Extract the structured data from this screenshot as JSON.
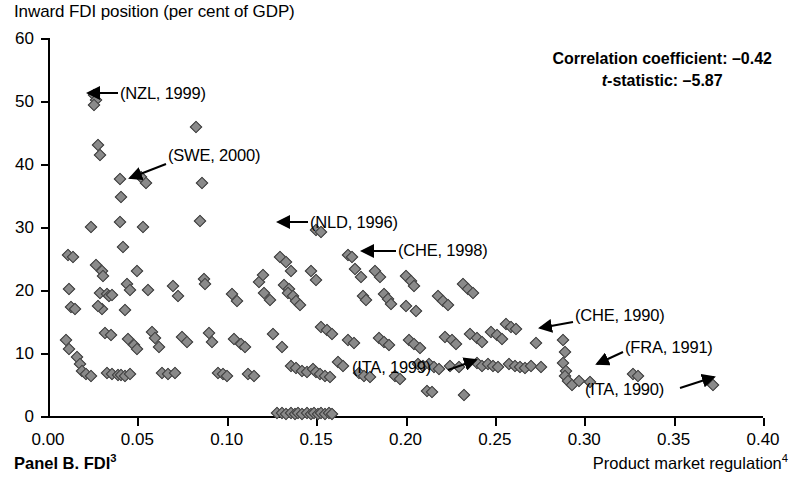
{
  "figure": {
    "y_axis_title": "Inward FDI position (per cent of GDP)",
    "panel_label_text": "Panel B. FDI",
    "panel_label_sup": "3",
    "x_axis_title_text": "Product market regulation",
    "x_axis_title_sup": "4"
  },
  "stats": {
    "correlation_label": "Correlation coefficient: –0.42",
    "tstat_prefix": "t",
    "tstat_label": "-statistic: –5.87"
  },
  "chart_data": {
    "type": "scatter",
    "title": "",
    "xlabel": "Product market regulation",
    "ylabel": "Inward FDI position (per cent of GDP)",
    "xlim": [
      0.0,
      0.4
    ],
    "ylim": [
      0,
      60
    ],
    "xticks": [
      "0.00",
      "0.05",
      "0.10",
      "0.15",
      "0.20",
      "0.25",
      "0.30",
      "0.35",
      "0.40"
    ],
    "xtick_values": [
      0.0,
      0.05,
      0.1,
      0.15,
      0.2,
      0.25,
      0.3,
      0.35,
      0.4
    ],
    "yticks": [
      "0",
      "10",
      "20",
      "30",
      "40",
      "50",
      "60"
    ],
    "ytick_values": [
      0,
      10,
      20,
      30,
      40,
      50,
      60
    ],
    "grid": false,
    "legend": "none",
    "correlation_coefficient": -0.42,
    "t_statistic": -5.87,
    "marker": "diamond",
    "marker_fill": "#8a8a8a",
    "marker_edge": "#3a3a3a",
    "points": [
      [
        0.011,
        25.6
      ],
      [
        0.014,
        25.2
      ],
      [
        0.012,
        20.2
      ],
      [
        0.013,
        17.3
      ],
      [
        0.015,
        17.0
      ],
      [
        0.01,
        12.0
      ],
      [
        0.012,
        10.6
      ],
      [
        0.016,
        9.4
      ],
      [
        0.018,
        8.3
      ],
      [
        0.019,
        7.2
      ],
      [
        0.021,
        6.6
      ],
      [
        0.024,
        6.4
      ],
      [
        0.026,
        50.9
      ],
      [
        0.027,
        50.1
      ],
      [
        0.026,
        49.4
      ],
      [
        0.028,
        43.0
      ],
      [
        0.029,
        41.4
      ],
      [
        0.024,
        30.0
      ],
      [
        0.027,
        24.0
      ],
      [
        0.03,
        23.0
      ],
      [
        0.031,
        22.2
      ],
      [
        0.029,
        19.6
      ],
      [
        0.033,
        19.4
      ],
      [
        0.034,
        19.0
      ],
      [
        0.036,
        19.2
      ],
      [
        0.03,
        17.0
      ],
      [
        0.028,
        17.4
      ],
      [
        0.032,
        13.2
      ],
      [
        0.035,
        12.8
      ],
      [
        0.033,
        6.8
      ],
      [
        0.036,
        6.6
      ],
      [
        0.039,
        6.5
      ],
      [
        0.041,
        6.5
      ],
      [
        0.043,
        6.4
      ],
      [
        0.046,
        6.6
      ],
      [
        0.04,
        37.6
      ],
      [
        0.041,
        34.8
      ],
      [
        0.04,
        30.8
      ],
      [
        0.042,
        26.8
      ],
      [
        0.044,
        21.0
      ],
      [
        0.046,
        20.0
      ],
      [
        0.043,
        16.8
      ],
      [
        0.045,
        12.2
      ],
      [
        0.048,
        11.3
      ],
      [
        0.05,
        10.6
      ],
      [
        0.052,
        38.0
      ],
      [
        0.055,
        37.0
      ],
      [
        0.053,
        30.0
      ],
      [
        0.05,
        23.0
      ],
      [
        0.056,
        20.0
      ],
      [
        0.058,
        13.4
      ],
      [
        0.06,
        12.4
      ],
      [
        0.062,
        11.0
      ],
      [
        0.064,
        6.8
      ],
      [
        0.067,
        6.6
      ],
      [
        0.071,
        6.8
      ],
      [
        0.07,
        20.6
      ],
      [
        0.073,
        19.0
      ],
      [
        0.075,
        12.6
      ],
      [
        0.078,
        11.8
      ],
      [
        0.083,
        45.8
      ],
      [
        0.086,
        37.0
      ],
      [
        0.085,
        31.0
      ],
      [
        0.087,
        21.8
      ],
      [
        0.088,
        21.0
      ],
      [
        0.09,
        13.2
      ],
      [
        0.092,
        11.8
      ],
      [
        0.095,
        6.8
      ],
      [
        0.098,
        6.6
      ],
      [
        0.1,
        6.4
      ],
      [
        0.103,
        19.4
      ],
      [
        0.106,
        18.2
      ],
      [
        0.104,
        12.2
      ],
      [
        0.108,
        11.4
      ],
      [
        0.11,
        11.0
      ],
      [
        0.112,
        6.6
      ],
      [
        0.115,
        6.4
      ],
      [
        0.118,
        21.2
      ],
      [
        0.12,
        22.4
      ],
      [
        0.121,
        19.6
      ],
      [
        0.124,
        18.4
      ],
      [
        0.126,
        13.0
      ],
      [
        0.128,
        0.4
      ],
      [
        0.131,
        0.4
      ],
      [
        0.133,
        0.3
      ],
      [
        0.136,
        0.4
      ],
      [
        0.138,
        0.3
      ],
      [
        0.14,
        0.4
      ],
      [
        0.142,
        0.3
      ],
      [
        0.145,
        0.4
      ],
      [
        0.147,
        0.3
      ],
      [
        0.149,
        0.4
      ],
      [
        0.151,
        0.3
      ],
      [
        0.153,
        0.4
      ],
      [
        0.155,
        0.3
      ],
      [
        0.157,
        0.4
      ],
      [
        0.159,
        0.3
      ],
      [
        0.13,
        25.2
      ],
      [
        0.133,
        24.4
      ],
      [
        0.136,
        23.0
      ],
      [
        0.132,
        20.8
      ],
      [
        0.135,
        20.2
      ],
      [
        0.134,
        19.6
      ],
      [
        0.137,
        19.0
      ],
      [
        0.139,
        18.2
      ],
      [
        0.141,
        17.6
      ],
      [
        0.131,
        11.0
      ],
      [
        0.136,
        8.0
      ],
      [
        0.139,
        7.6
      ],
      [
        0.142,
        7.2
      ],
      [
        0.145,
        7.0
      ],
      [
        0.148,
        7.4
      ],
      [
        0.15,
        7.0
      ],
      [
        0.152,
        6.6
      ],
      [
        0.155,
        6.4
      ],
      [
        0.158,
        6.2
      ],
      [
        0.147,
        23.0
      ],
      [
        0.15,
        21.6
      ],
      [
        0.153,
        14.2
      ],
      [
        0.156,
        13.6
      ],
      [
        0.159,
        13.0
      ],
      [
        0.162,
        8.6
      ],
      [
        0.165,
        8.0
      ],
      [
        0.15,
        29.6
      ],
      [
        0.153,
        29.2
      ],
      [
        0.168,
        25.6
      ],
      [
        0.17,
        25.2
      ],
      [
        0.172,
        23.4
      ],
      [
        0.175,
        22.0
      ],
      [
        0.176,
        19.0
      ],
      [
        0.178,
        18.4
      ],
      [
        0.168,
        12.0
      ],
      [
        0.171,
        11.6
      ],
      [
        0.174,
        6.8
      ],
      [
        0.177,
        6.4
      ],
      [
        0.18,
        6.2
      ],
      [
        0.183,
        23.0
      ],
      [
        0.186,
        22.0
      ],
      [
        0.188,
        19.4
      ],
      [
        0.19,
        18.6
      ],
      [
        0.192,
        17.8
      ],
      [
        0.185,
        12.4
      ],
      [
        0.188,
        11.8
      ],
      [
        0.191,
        11.2
      ],
      [
        0.194,
        6.4
      ],
      [
        0.197,
        5.8
      ],
      [
        0.2,
        22.2
      ],
      [
        0.203,
        21.4
      ],
      [
        0.205,
        20.6
      ],
      [
        0.2,
        17.4
      ],
      [
        0.206,
        16.6
      ],
      [
        0.202,
        12.0
      ],
      [
        0.205,
        11.4
      ],
      [
        0.208,
        10.8
      ],
      [
        0.207,
        8.2
      ],
      [
        0.21,
        8.0
      ],
      [
        0.213,
        8.2
      ],
      [
        0.216,
        7.8
      ],
      [
        0.219,
        7.4
      ],
      [
        0.212,
        4.0
      ],
      [
        0.215,
        3.8
      ],
      [
        0.218,
        19.0
      ],
      [
        0.221,
        18.2
      ],
      [
        0.224,
        17.6
      ],
      [
        0.222,
        12.6
      ],
      [
        0.226,
        12.0
      ],
      [
        0.228,
        11.4
      ],
      [
        0.225,
        8.0
      ],
      [
        0.23,
        7.8
      ],
      [
        0.233,
        3.4
      ],
      [
        0.232,
        21.0
      ],
      [
        0.235,
        20.2
      ],
      [
        0.238,
        19.6
      ],
      [
        0.236,
        13.0
      ],
      [
        0.24,
        12.4
      ],
      [
        0.243,
        11.8
      ],
      [
        0.24,
        8.4
      ],
      [
        0.243,
        8.0
      ],
      [
        0.246,
        8.2
      ],
      [
        0.249,
        8.0
      ],
      [
        0.252,
        7.8
      ],
      [
        0.248,
        13.4
      ],
      [
        0.251,
        12.8
      ],
      [
        0.254,
        12.2
      ],
      [
        0.256,
        14.6
      ],
      [
        0.259,
        14.2
      ],
      [
        0.262,
        13.8
      ],
      [
        0.258,
        8.2
      ],
      [
        0.261,
        8.0
      ],
      [
        0.264,
        7.8
      ],
      [
        0.267,
        7.6
      ],
      [
        0.27,
        8.0
      ],
      [
        0.273,
        11.6
      ],
      [
        0.276,
        7.8
      ],
      [
        0.288,
        12.0
      ],
      [
        0.289,
        10.2
      ],
      [
        0.288,
        8.4
      ],
      [
        0.29,
        7.2
      ],
      [
        0.289,
        6.4
      ],
      [
        0.291,
        5.6
      ],
      [
        0.293,
        5.0
      ],
      [
        0.297,
        5.6
      ],
      [
        0.303,
        5.4
      ],
      [
        0.327,
        6.6
      ],
      [
        0.33,
        6.4
      ],
      [
        0.372,
        5.0
      ]
    ]
  },
  "annotations": [
    {
      "label": "(NZL, 1999)",
      "text_x": 120,
      "text_y": 84,
      "arrow_from_x": 118,
      "arrow_from_y": 93,
      "arrow_to_x": 88,
      "arrow_to_y": 93
    },
    {
      "label": "(SWE, 2000)",
      "text_x": 168,
      "text_y": 146,
      "arrow_from_x": 166,
      "arrow_from_y": 164,
      "arrow_to_x": 130,
      "arrow_to_y": 178
    },
    {
      "label": "(NLD, 1996)",
      "text_x": 310,
      "text_y": 213,
      "arrow_from_x": 308,
      "arrow_from_y": 222,
      "arrow_to_x": 278,
      "arrow_to_y": 222
    },
    {
      "label": "(CHE, 1998)",
      "text_x": 398,
      "text_y": 241,
      "arrow_from_x": 396,
      "arrow_from_y": 251,
      "arrow_to_x": 362,
      "arrow_to_y": 251
    },
    {
      "label": "(CHE, 1990)",
      "text_x": 575,
      "text_y": 306,
      "arrow_from_x": 573,
      "arrow_from_y": 322,
      "arrow_to_x": 540,
      "arrow_to_y": 328
    },
    {
      "label": "(FRA, 1991)",
      "text_x": 625,
      "text_y": 338,
      "arrow_from_x": 623,
      "arrow_from_y": 352,
      "arrow_to_x": 597,
      "arrow_to_y": 364
    },
    {
      "label": "(ITA, 1999)",
      "text_x": 352,
      "text_y": 358,
      "arrow_from_x": 448,
      "arrow_from_y": 370,
      "arrow_to_x": 476,
      "arrow_to_y": 360
    },
    {
      "label": "(ITA, 1990)",
      "text_x": 585,
      "text_y": 380,
      "arrow_from_x": 680,
      "arrow_from_y": 388,
      "arrow_to_x": 714,
      "arrow_to_y": 377
    }
  ]
}
